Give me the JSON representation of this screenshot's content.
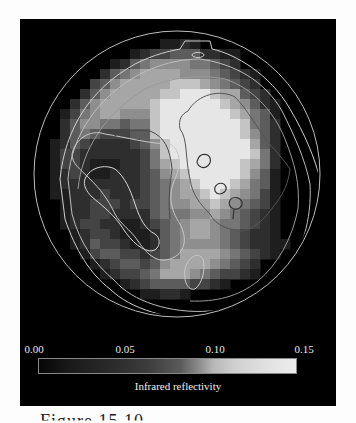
{
  "chart_data": {
    "type": "heatmap",
    "title": "",
    "colorbar": {
      "label": "Infrared reflectivity",
      "min": 0.0,
      "max": 0.15,
      "ticks": [
        "0.00",
        "0.05",
        "0.10",
        "0.15"
      ],
      "colormap": "black-to-white grayscale"
    },
    "grid": {
      "origin_px": [
        10,
        10
      ],
      "cell_px": 10,
      "levels": 10,
      "rows": [
        "..............................",
        "..............................",
        "..............1121............",
        "...........12334442211........",
        ".........1245666655432........",
        "........2456777766654321......",
        ".......34677777888765432......",
        "......2467777788999877432.....",
        ".....246777778999999876421....",
        "....1356776668999999987541....",
        "....2466554558999999998542....",
        "....2454333448999999998642....",
        "...12432222346899999999742....",
        "...13322222235899999999852....",
        "...13321112235789999998752....",
        "...12321122234678999998641....",
        "...12222222234567899987541....",
        "...11222322234567789876531....",
        "....1223332334566778765431....",
        "....1223322224555667654321....",
        "....1233221123456776554321....",
        ".....123321112456776543221....",
        ".....1243321124566665432211...",
        "......13443323457777654321....",
        ".......12344346777765432.....",
        "........1233457776543321......",
        "..........12344443321.........",
        "............11221.............",
        "..............................",
        ".............................."
      ]
    },
    "disk": {
      "center_px": [
        157,
        155
      ],
      "radius_px": 143
    },
    "contours_shown": true
  },
  "colorbar": {
    "ticks": [
      {
        "label": "0.00",
        "x": 14
      },
      {
        "label": "0.05",
        "x": 105
      },
      {
        "label": "0.10",
        "x": 195
      },
      {
        "label": "0.15",
        "x": 284
      }
    ],
    "label": "Infrared reflectivity"
  },
  "caption": {
    "text": "Figure 15.10"
  }
}
